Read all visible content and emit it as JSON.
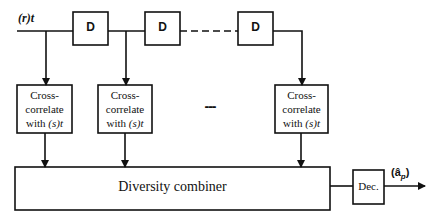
{
  "diagram": {
    "input_label": "(r)t",
    "delay_blocks": [
      {
        "label": "D"
      },
      {
        "label": "D"
      },
      {
        "label": "D"
      }
    ],
    "correlators": [
      {
        "line1": "Cross-",
        "line2": "correlate",
        "line3_prefix": "with ",
        "line3_signal": "(s)t"
      },
      {
        "line1": "Cross-",
        "line2": "correlate",
        "line3_prefix": "with ",
        "line3_signal": "(s)t"
      },
      {
        "line1": "Cross-",
        "line2": "correlate",
        "line3_prefix": "with ",
        "line3_signal": "(s)t"
      }
    ],
    "ellipsis_between_correlators": "---",
    "combiner_label": "Diversity combiner",
    "decision_label": "Dec.",
    "output_label": "(â",
    "output_subscript": "p",
    "output_close": ")",
    "colors": {
      "line": "#111111",
      "background": "#ffffff"
    }
  }
}
